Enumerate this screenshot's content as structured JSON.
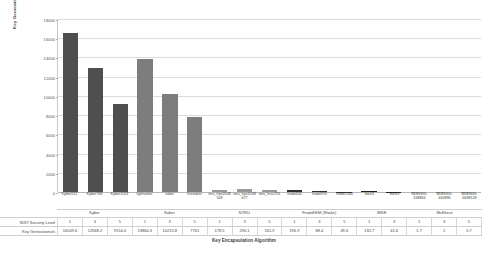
{
  "chart_data": {
    "type": "bar",
    "title": "",
    "xlabel": "Key Encapsulation Algorithm",
    "ylabel": "Key Generations Per Second",
    "ylim": [
      0,
      18000
    ],
    "yticks": [
      0,
      2000,
      4000,
      6000,
      8000,
      10000,
      12000,
      14000,
      16000,
      18000
    ],
    "grid": true,
    "legend": "none",
    "categories": [
      "Kyber512",
      "Kyber768",
      "Kyber1024",
      "lightsaber",
      "saber",
      "firesaber",
      "ntru_hps2048509",
      "ntru_hps2048677",
      "ntru_hrss701",
      "frodo640",
      "frodo976",
      "frodo1344",
      "bikel1",
      "bikel3",
      "McEliece-348864",
      "McEliece-460896",
      "McEliece-6688128"
    ],
    "values": [
      16549.6,
      12948.2,
      9154.4,
      13860.3,
      10215.8,
      7761,
      178.5,
      290.1,
      161.9,
      196.9,
      88.4,
      49.6,
      132.7,
      41.6,
      1.7,
      1,
      0.7
    ],
    "bar_colors": [
      "#4f4f4f",
      "#4f4f4f",
      "#4f4f4f",
      "#7d7d7d",
      "#7d7d7d",
      "#7d7d7d",
      "#9a9a9a",
      "#9a9a9a",
      "#9a9a9a",
      "#2e2e2e",
      "#2e2e2e",
      "#2e2e2e",
      "#1f1f1f",
      "#1f1f1f",
      "#8c8c8c",
      "#8c8c8c",
      "#8c8c8c"
    ],
    "security_levels": [
      "1",
      "3",
      "5",
      "1",
      "3",
      "5",
      "1",
      "3",
      "5",
      "1",
      "3",
      "5",
      "1",
      "3",
      "1",
      "3",
      "5"
    ],
    "families": [
      {
        "name": "Kyber",
        "span": 3
      },
      {
        "name": "Saber",
        "span": 3
      },
      {
        "name": "NTRU",
        "span": 3
      },
      {
        "name": "FrodoKEM (Shake)",
        "span": 3
      },
      {
        "name": "BIKE",
        "span": 2
      },
      {
        "name": "McEliece",
        "span": 3
      }
    ],
    "rows": {
      "level_label": "NIST Security Level",
      "value_label": "Key Generations/s"
    }
  }
}
